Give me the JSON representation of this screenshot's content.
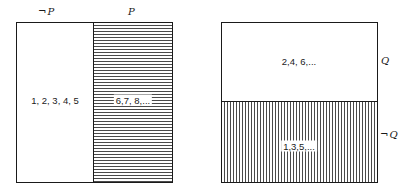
{
  "diagrams": [
    {
      "id": "partition-p",
      "orientation": "vertical-split",
      "regions": [
        {
          "label": "¬P",
          "label_symbol": "¬",
          "label_var": "P",
          "members": "1, 2, 3, 4, 5",
          "shading": "none"
        },
        {
          "label": "P",
          "label_var": "P",
          "members": "6,7, 8,...",
          "shading": "horizontal-lines"
        }
      ]
    },
    {
      "id": "partition-q",
      "orientation": "horizontal-split",
      "regions": [
        {
          "label": "Q",
          "label_var": "Q",
          "members": "2,4, 6,...",
          "shading": "none"
        },
        {
          "label": "¬Q",
          "label_symbol": "¬",
          "label_var": "Q",
          "members": "1,3,5,...",
          "shading": "vertical-lines"
        }
      ]
    }
  ],
  "colors": {
    "line": "#1a1a1a",
    "hatch": "#4a4a4a",
    "background": "#ffffff"
  }
}
